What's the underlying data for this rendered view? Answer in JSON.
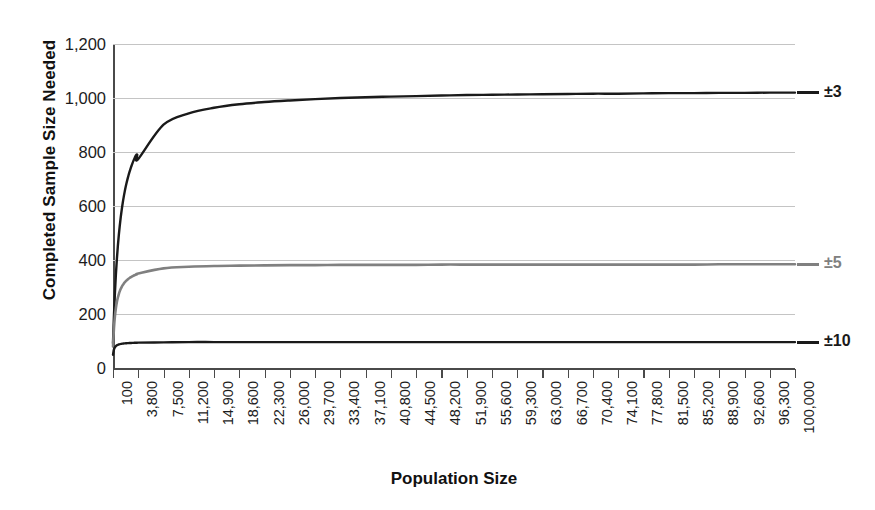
{
  "chart_data": {
    "type": "line",
    "title": "",
    "xlabel": "Population Size",
    "ylabel": "Completed Sample Size Needed",
    "ylim": [
      0,
      1200
    ],
    "yticks": [
      0,
      200,
      400,
      600,
      800,
      1000,
      1200
    ],
    "ytick_labels": [
      "0",
      "200",
      "400",
      "600",
      "800",
      "1,000",
      "1,200"
    ],
    "grid": true,
    "legend_position": "right-of-plot-at-line-ends",
    "x": [
      100,
      3800,
      7500,
      11200,
      14900,
      18600,
      22300,
      26000,
      29700,
      33400,
      37100,
      40800,
      44500,
      48200,
      51900,
      55600,
      59300,
      63000,
      66700,
      70400,
      74100,
      77800,
      81500,
      85200,
      88900,
      92600,
      96300,
      100000
    ],
    "xtick_labels": [
      "100",
      "3,800",
      "7,500",
      "11,200",
      "14,900",
      "18,600",
      "22,300",
      "26,000",
      "29,700",
      "33,400",
      "37,100",
      "40,800",
      "44,500",
      "48,200",
      "51,900",
      "55,600",
      "59,300",
      "63,000",
      "66,700",
      "70,400",
      "74,100",
      "77,800",
      "81,500",
      "85,200",
      "88,900",
      "92,600",
      "96,300",
      "100,000"
    ],
    "series": [
      {
        "name": "±3",
        "label": "±3",
        "color": "#1a1a1a",
        "margin_of_error_percent": 3,
        "values": [
          92,
          774,
          901,
          943,
          964,
          977,
          985,
          991,
          996,
          1000,
          1003,
          1005,
          1007,
          1009,
          1011,
          1012,
          1013,
          1014,
          1015,
          1016,
          1016,
          1017,
          1018,
          1018,
          1019,
          1019,
          1020,
          1020
        ],
        "asymptote": 1040
      },
      {
        "name": "±5",
        "label": "±5",
        "color": "#808080",
        "margin_of_error_percent": 5,
        "values": [
          80,
          350,
          369,
          375,
          378,
          379,
          380,
          381,
          381,
          382,
          382,
          382,
          382,
          383,
          383,
          383,
          383,
          383,
          383,
          383,
          383,
          383,
          383,
          383,
          384,
          384,
          384,
          384
        ],
        "asymptote": 384
      },
      {
        "name": "±10",
        "label": "±10",
        "color": "#1a1a1a",
        "margin_of_error_percent": 10,
        "values": [
          49,
          94,
          95,
          96,
          96,
          96,
          96,
          96,
          96,
          96,
          96,
          96,
          96,
          96,
          96,
          96,
          96,
          96,
          96,
          96,
          96,
          96,
          96,
          96,
          96,
          96,
          96,
          96
        ],
        "asymptote": 96
      }
    ]
  },
  "axis": {
    "y_title": "Completed Sample Size Needed",
    "x_title": "Population Size"
  },
  "colors": {
    "series_black": "#1a1a1a",
    "series_gray": "#808080",
    "gridline": "#c4c4c4",
    "axis": "#4a4a4a",
    "background": "#ffffff"
  }
}
